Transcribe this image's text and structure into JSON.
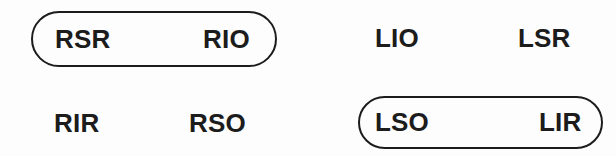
{
  "figure": {
    "background_color": "#fdfdfd",
    "ink_color": "#1c1c1c",
    "groups": [
      {
        "position": "top-left",
        "boxed": true,
        "left_label": "RSR",
        "right_label": "RIO"
      },
      {
        "position": "top-right",
        "boxed": false,
        "left_label": "LIO",
        "right_label": "LSR"
      },
      {
        "position": "bottom-left",
        "boxed": false,
        "left_label": "RIR",
        "right_label": "RSO"
      },
      {
        "position": "bottom-right",
        "boxed": true,
        "left_label": "LSO",
        "right_label": "LIR"
      }
    ]
  }
}
